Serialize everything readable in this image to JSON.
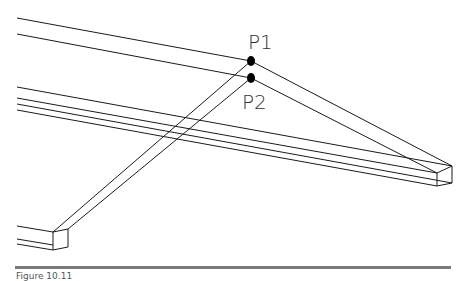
{
  "diagram": {
    "labels": {
      "p1": "P1",
      "p2": "P2"
    },
    "points": {
      "p1": {
        "x": 251,
        "y": 61
      },
      "p2": {
        "x": 251,
        "y": 78
      }
    },
    "colors": {
      "line": "#1a1a1a",
      "node": "#000000",
      "label": "#333333",
      "rule": "#7a7a7a"
    }
  },
  "caption": {
    "text": "Figure 10.11"
  }
}
